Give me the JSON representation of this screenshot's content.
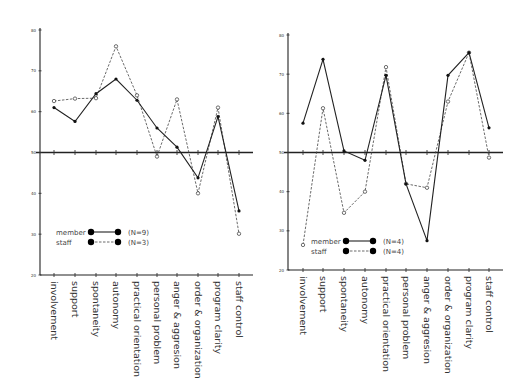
{
  "chart_data": [
    {
      "type": "line",
      "title": "",
      "xlabel": "",
      "ylabel": "",
      "ylim": [
        20,
        80
      ],
      "yticks": [
        80,
        70,
        60,
        50,
        40,
        30,
        20
      ],
      "baseline": 50,
      "categories": [
        "involvement",
        "support",
        "spontaneity",
        "autonomy",
        "practical orientation",
        "personal problem",
        "anger & aggresion",
        "order & organization",
        "program clarity",
        "staff control"
      ],
      "series": [
        {
          "name": "member",
          "n_label": "(N=9)",
          "style": "solid",
          "values": [
            61,
            57.6,
            64.4,
            68,
            62.8,
            56,
            51.3,
            43.8,
            58.8,
            35.7
          ]
        },
        {
          "name": "staff",
          "n_label": "(N=3)",
          "style": "dashed",
          "values": [
            62.6,
            63.2,
            63.3,
            76,
            64,
            49,
            63,
            40,
            61,
            30.1
          ]
        }
      ],
      "legend": {
        "position": "lower-left"
      },
      "grid": false
    },
    {
      "type": "line",
      "title": "",
      "xlabel": "",
      "ylabel": "",
      "ylim": [
        20,
        80
      ],
      "yticks": [
        80,
        70,
        60,
        50,
        40,
        30,
        20
      ],
      "baseline": 50,
      "categories": [
        "involvement",
        "support",
        "spontaneity",
        "autonomy",
        "practical orientation",
        "personal problem",
        "anger & aggresion",
        "order & organization",
        "program clarity",
        "staff control"
      ],
      "series": [
        {
          "name": "member",
          "n_label": "(N=4)",
          "style": "solid",
          "values": [
            57.5,
            73.8,
            50.4,
            48,
            69.7,
            42,
            27.5,
            69.7,
            75.5,
            56.3
          ]
        },
        {
          "name": "staff",
          "n_label": "(N=4)",
          "style": "dashed",
          "values": [
            26.4,
            61.3,
            34.6,
            40,
            71.8,
            42,
            41,
            63,
            75.5,
            48.7
          ]
        }
      ],
      "legend": {
        "position": "lower-left"
      },
      "grid": false
    }
  ],
  "layout": [
    {
      "x0": 40,
      "y_top": 30,
      "y_bot": 275,
      "x_end": 253,
      "xs": [
        54,
        75,
        96,
        116,
        137,
        157,
        177,
        198,
        218,
        239
      ],
      "legend": {
        "x": 56,
        "y": 232
      }
    },
    {
      "x0": 288,
      "y_top": 35,
      "y_bot": 270,
      "x_end": 503,
      "xs": [
        303,
        323,
        344,
        365,
        386,
        406,
        427,
        448,
        469,
        489
      ],
      "legend": {
        "x": 311,
        "y": 241
      }
    }
  ]
}
